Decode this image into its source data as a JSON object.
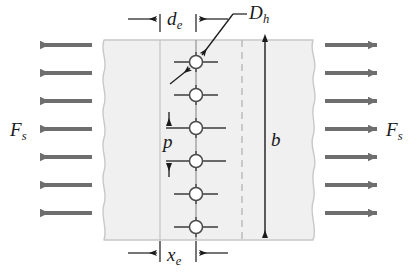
{
  "figure": {
    "type": "engineering-diagram"
  },
  "labels": {
    "force_left": {
      "symbol": "F",
      "subscript": "s"
    },
    "force_right": {
      "symbol": "F",
      "subscript": "s"
    },
    "edge_distance_top": {
      "symbol": "d",
      "subscript": "e"
    },
    "hole_diameter": {
      "symbol": "D",
      "subscript": "h"
    },
    "pitch": {
      "symbol": "p",
      "subscript": ""
    },
    "width": {
      "symbol": "b",
      "subscript": ""
    },
    "edge_distance_bottom": {
      "symbol": "x",
      "subscript": "e"
    }
  },
  "geometry": {
    "plate": {
      "top_y": 40,
      "bottom_y": 240,
      "left_x": 104,
      "right_x": 313,
      "fill": "#f0f0f0",
      "edge_stroke": "#c8c8c8"
    },
    "holes": {
      "count": 6,
      "center_x": 196,
      "first_center_y": 62,
      "pitch_px": 33,
      "radius": 6.5,
      "fill": "#ffffff",
      "stroke": "#4a4a4a"
    },
    "reference_lines": {
      "left_vertical_x": 160,
      "hole_center_vertical_x": 196,
      "dashed_vertical_x": 242
    },
    "width_arrow_x": 265,
    "force_arrows": {
      "count_per_side": 7,
      "color": "#6e6e6e",
      "left_tail_x": 92,
      "left_head_x": 34,
      "right_tail_x": 325,
      "right_head_x": 383,
      "ys": [
        45,
        73,
        101,
        129,
        157,
        185,
        213
      ]
    }
  },
  "colors": {
    "arrow": "#6e6e6e",
    "plate_fill": "#f0f0f0",
    "plate_edge": "#c8c8c8",
    "dimension_line": "#1a1a1a",
    "centerline": "#7a7a7a",
    "dashed_line": "#b4b4b4",
    "text": "#1a1a1a"
  }
}
